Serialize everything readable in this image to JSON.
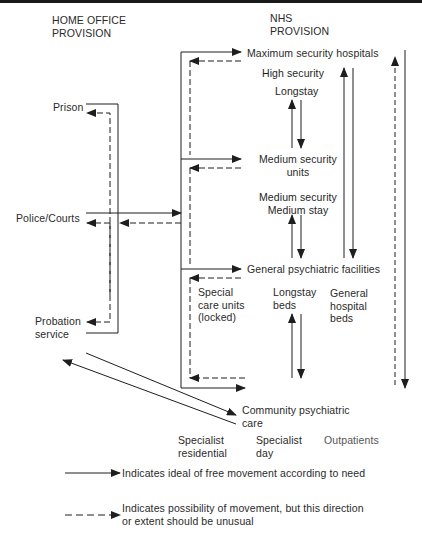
{
  "headers": {
    "home_office_line1": "HOME OFFICE",
    "home_office_line2": "PROVISION",
    "nhs_line1": "NHS",
    "nhs_line2": "PROVISION"
  },
  "home_office_nodes": {
    "prison": "Prison",
    "police_courts": "Police/Courts",
    "probation_line1": "Probation",
    "probation_line2": "service"
  },
  "nhs_nodes": {
    "maximum_security": "Maximum security hospitals",
    "high_security": "High security",
    "longstay": "Longstay",
    "medium_units_line1": "Medium security",
    "medium_units_line2": "units",
    "medium_security": "Medium security",
    "medium_stay": "Medium stay",
    "general_psychiatric": "General psychiatric facilities",
    "special_care_line1": "Special",
    "special_care_line2": "care units",
    "special_care_line3": "(locked)",
    "longstay_beds_line1": "Longstay",
    "longstay_beds_line2": "beds",
    "general_hospital_line1": "General",
    "general_hospital_line2": "hospital",
    "general_hospital_line3": "beds",
    "community_line1": "Community psychiatric",
    "community_line2": "care",
    "specialist_residential_line1": "Specialist",
    "specialist_residential_line2": "residential",
    "specialist_day_line1": "Specialist",
    "specialist_day_line2": "day",
    "outpatients": "Outpatients"
  },
  "legend": {
    "solid": "Indicates ideal of free movement according to need",
    "dashed_line1": "Indicates possibility of movement, but this direction",
    "dashed_line2": "or extent should be unusual"
  },
  "colors": {
    "line": "#1e1e1e",
    "text": "#2a2a2a",
    "background": "#ffffff"
  }
}
